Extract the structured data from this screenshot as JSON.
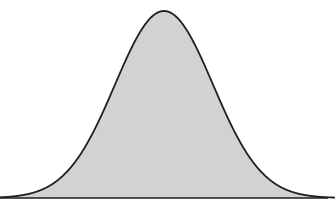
{
  "figure": {
    "title": "",
    "subtitle": "",
    "caption": "",
    "background_color": "#ffffff",
    "width": 335,
    "height": 211
  },
  "chart_data": {
    "type": "area",
    "title": "",
    "subtitle": "",
    "xlabel": "",
    "ylabel": "",
    "annotations": [],
    "legend": [],
    "legend_position": "none",
    "grid": false,
    "axis": {
      "x_axis_visible": true,
      "y_axis_visible": false,
      "x_tick_labels": [],
      "y_tick_labels": [],
      "xlim": [
        0,
        335
      ],
      "ylim": [
        0,
        1
      ]
    },
    "distribution": {
      "name": "normal",
      "mean_px": 164,
      "sigma_px": 49,
      "peak_x_px": 165,
      "peak_y_px": 11,
      "baseline_y_px": 198,
      "baseline_x_start_px": 0,
      "baseline_x_end_px": 328,
      "curve_contact_left_px": 35,
      "curve_contact_right_px": 298,
      "amplitude_px": 187
    },
    "style": {
      "fill_color": "#d2d2d2",
      "stroke_color": "#1f1f1f",
      "stroke_width_px": 1.8,
      "baseline_color": "#1f1f1f",
      "baseline_width_px": 1.6
    },
    "x": [
      0,
      10,
      20,
      30,
      40,
      50,
      60,
      70,
      80,
      90,
      100,
      110,
      120,
      130,
      140,
      150,
      160,
      164,
      170,
      180,
      190,
      200,
      210,
      220,
      230,
      240,
      250,
      260,
      270,
      280,
      290,
      300,
      310,
      320,
      328
    ],
    "values": [
      0.0,
      0.001,
      0.003,
      0.008,
      0.019,
      0.041,
      0.081,
      0.145,
      0.238,
      0.358,
      0.495,
      0.633,
      0.757,
      0.86,
      0.94,
      0.988,
      0.999,
      1.0,
      0.998,
      0.972,
      0.914,
      0.828,
      0.718,
      0.595,
      0.468,
      0.348,
      0.245,
      0.163,
      0.102,
      0.06,
      0.033,
      0.017,
      0.008,
      0.004,
      0.002
    ]
  }
}
